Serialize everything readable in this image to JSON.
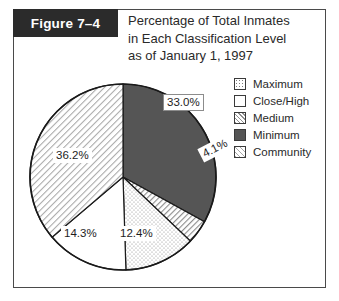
{
  "figure": {
    "number_label": "Figure 7–4",
    "title_lines": [
      "Percentage of Total Inmates",
      "in Each Classification Level",
      "as of January 1, 1997"
    ]
  },
  "legend": {
    "items": [
      {
        "label": "Maximum",
        "pattern": "dotted",
        "swatch_class": "sw-dotted"
      },
      {
        "label": "Close/High",
        "pattern": "blank",
        "swatch_class": "sw-blank"
      },
      {
        "label": "Medium",
        "pattern": "hatch",
        "swatch_class": "sw-hatch-med"
      },
      {
        "label": "Minimum",
        "pattern": "solid",
        "swatch_class": "sw-solid"
      },
      {
        "label": "Community",
        "pattern": "hatch-light",
        "swatch_class": "sw-hatch-com"
      }
    ]
  },
  "colors": {
    "frame_border": "#4a4a4a",
    "tab_background": "#2b2b2b",
    "tab_text": "#ffffff",
    "minimum_solid": "#555555",
    "pie_outline": "#1a1a1a",
    "text": "#2a2a2a"
  },
  "chart_data": {
    "type": "pie",
    "title": "Percentage of Total Inmates in Each Classification Level as of January 1, 1997",
    "xlabel": "",
    "ylabel": "",
    "units": "percent",
    "legend_position": "right",
    "start_angle_deg": 0,
    "direction": "clockwise",
    "categories": [
      "Minimum",
      "Medium",
      "Maximum",
      "Close/High",
      "Community"
    ],
    "values": [
      33.0,
      4.1,
      12.4,
      14.3,
      36.2
    ],
    "labels": [
      "33.0%",
      "4.1%",
      "12.4%",
      "14.3%",
      "36.2%"
    ],
    "slices": [
      {
        "name": "Minimum",
        "value": 33.0,
        "label": "33.0%",
        "pattern": "solid"
      },
      {
        "name": "Medium",
        "value": 4.1,
        "label": "4.1%",
        "pattern": "hatch"
      },
      {
        "name": "Maximum",
        "value": 12.4,
        "label": "12.4%",
        "pattern": "dotted"
      },
      {
        "name": "Close/High",
        "value": 14.3,
        "label": "14.3%",
        "pattern": "blank"
      },
      {
        "name": "Community",
        "value": 36.2,
        "label": "36.2%",
        "pattern": "hatch-light"
      }
    ]
  }
}
